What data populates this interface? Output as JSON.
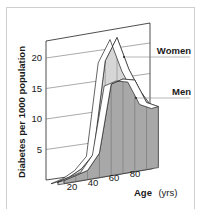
{
  "chart_data": {
    "type": "area",
    "title": "",
    "xlabel": "Age (yrs)",
    "xlabel_bold": "Age",
    "xlabel_unit": "(yrs)",
    "ylabel": "Diabetes per 1000 population",
    "x": [
      0,
      10,
      20,
      30,
      40,
      50,
      60,
      70,
      80
    ],
    "x_ticks": [
      "20",
      "40",
      "60",
      "80"
    ],
    "y_ticks": [
      "5",
      "10",
      "15",
      "20"
    ],
    "ylim": [
      0,
      25
    ],
    "xlim": [
      0,
      85
    ],
    "grid": true,
    "style": "3d-ribbon",
    "series": [
      {
        "name": "Women",
        "values": [
          0.5,
          1,
          2,
          4,
          19,
          22.5,
          17,
          13,
          10
        ],
        "color": "#d6d6d6"
      },
      {
        "name": "Men",
        "values": [
          0.5,
          1,
          1.5,
          4,
          15,
          15.5,
          15,
          11,
          10
        ],
        "color": "#a8a8a8"
      }
    ],
    "legend_position": "right, inline labels with leader lines"
  }
}
